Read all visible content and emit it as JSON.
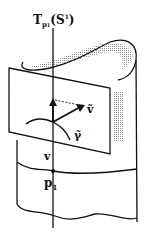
{
  "diagram": {
    "title_label": {
      "main": "T",
      "sub": "p",
      "subsub": "1",
      "paren_open": "(S",
      "sup": "1",
      "paren_close": ")"
    },
    "labels": {
      "v_tilde": "ṽ",
      "gamma_tilde": "γ̃",
      "v": "v",
      "p1_main": "p",
      "p1_sub": "1"
    },
    "colors": {
      "stroke": "#111111",
      "shade": "#9a9a9a",
      "background": "#ffffff"
    }
  }
}
